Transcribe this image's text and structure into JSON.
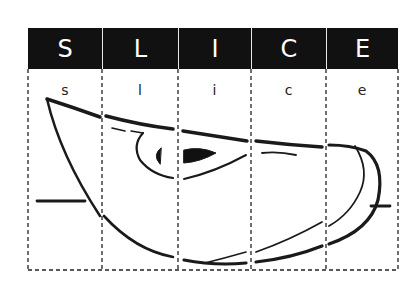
{
  "title_letters": [
    "S",
    "L",
    "I",
    "C",
    "E"
  ],
  "lower_letters": [
    "s",
    "l",
    "i",
    "c",
    "e"
  ],
  "colors": {
    "header_bg": "#111111",
    "header_text": "#ffffff",
    "line": "#1a1a1a",
    "background": "#ffffff"
  },
  "diagram": {
    "columns": 5
  }
}
